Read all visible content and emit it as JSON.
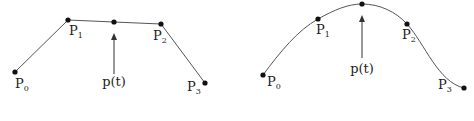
{
  "diagrams": [
    {
      "name": "linear-polyline",
      "points": [
        {
          "label": "P",
          "sub": "0"
        },
        {
          "label": "P",
          "sub": "1"
        },
        {
          "label": "P",
          "sub": "2"
        },
        {
          "label": "P",
          "sub": "3"
        }
      ],
      "curve_point_label": "p(t)"
    },
    {
      "name": "smooth-curve",
      "points": [
        {
          "label": "P",
          "sub": "0"
        },
        {
          "label": "P",
          "sub": "1"
        },
        {
          "label": "P",
          "sub": "2"
        },
        {
          "label": "P",
          "sub": "3"
        }
      ],
      "curve_point_label": "p(t)"
    }
  ],
  "colors": {
    "stroke": "#555555",
    "point": "#111111",
    "text": "#222222"
  }
}
